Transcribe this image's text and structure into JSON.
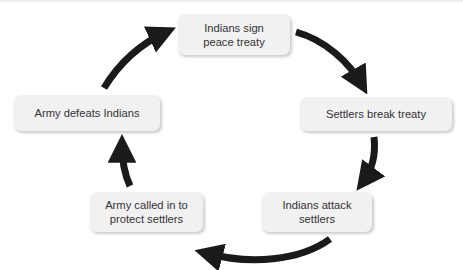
{
  "diagram": {
    "type": "cycle",
    "direction": "clockwise",
    "background_color": "#ffffff",
    "node_fill_color": "#f1f1f1",
    "node_text_color": "#333333",
    "arrow_color": "#1a1a1a",
    "nodes": [
      {
        "id": "top",
        "label": "Indians sign\npeace treaty"
      },
      {
        "id": "right",
        "label": "Settlers break treaty"
      },
      {
        "id": "bottomright",
        "label": "Indians attack\nsettlers"
      },
      {
        "id": "bottomleft",
        "label": "Army called in to\nprotect settlers"
      },
      {
        "id": "left",
        "label": "Army defeats Indians"
      }
    ],
    "edges": [
      {
        "from": "top",
        "to": "right",
        "arrow": "curved"
      },
      {
        "from": "right",
        "to": "bottomright",
        "arrow": "curved"
      },
      {
        "from": "bottomright",
        "to": "bottomleft",
        "arrow": "curved"
      },
      {
        "from": "bottomleft",
        "to": "left",
        "arrow": "curved"
      },
      {
        "from": "left",
        "to": "top",
        "arrow": "curved"
      }
    ]
  }
}
